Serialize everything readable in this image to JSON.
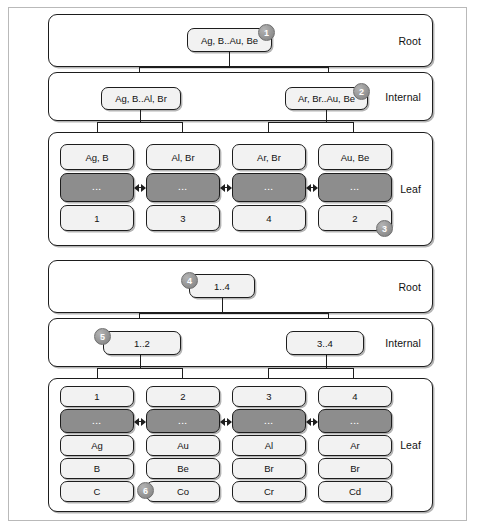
{
  "figure": {
    "layer_labels": {
      "root": "Root",
      "internal": "Internal",
      "leaf": "Leaf"
    }
  },
  "diagrams": [
    {
      "id": "value-indexed-tree",
      "root": {
        "label": "Ag, B..Au, Be",
        "badge": "1"
      },
      "internal": [
        {
          "label": "Ag, B..Al, Br",
          "badge": null
        },
        {
          "label": "Ar, Br..Au, Be",
          "badge": "2"
        }
      ],
      "leaves": [
        {
          "top": "Ag, B",
          "dots": "...",
          "bottom": "1",
          "badge": null
        },
        {
          "top": "Al, Br",
          "dots": "...",
          "bottom": "3",
          "badge": null
        },
        {
          "top": "Ar, Br",
          "dots": "...",
          "bottom": "4",
          "badge": null
        },
        {
          "top": "Au, Be",
          "dots": "...",
          "bottom": "2",
          "badge": "3"
        }
      ]
    },
    {
      "id": "id-indexed-tree",
      "root": {
        "label": "1..4",
        "badge": "4"
      },
      "internal": [
        {
          "label": "1..2",
          "badge": "5"
        },
        {
          "label": "3..4",
          "badge": null
        }
      ],
      "leaves": [
        {
          "top": "1",
          "dots": "...",
          "rows": [
            "Ag",
            "B",
            "C"
          ],
          "badge": null
        },
        {
          "top": "2",
          "dots": "...",
          "rows": [
            "Au",
            "Be",
            "Co"
          ],
          "badge": "6"
        },
        {
          "top": "3",
          "dots": "...",
          "rows": [
            "Al",
            "Br",
            "Cr"
          ],
          "badge": null
        },
        {
          "top": "4",
          "dots": "...",
          "rows": [
            "Ar",
            "Br",
            "Cd"
          ],
          "badge": null
        }
      ]
    }
  ],
  "colors": {
    "outline": "#1d1d1d",
    "node_fill": "#f2f2f2",
    "dots_band": "#8d8d8d",
    "badge_fill": "#9a9a9a",
    "page_border": "#b9b9b9"
  }
}
